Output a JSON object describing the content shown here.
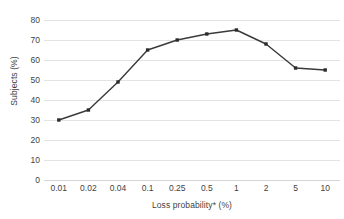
{
  "chart_data": {
    "type": "line",
    "title": "",
    "xlabel": "Loss probability* (%)",
    "ylabel": "Subjects (%)",
    "categories": [
      "0.01",
      "0.02",
      "0.04",
      "0.1",
      "0.25",
      "0.5",
      "1",
      "2",
      "5",
      "10"
    ],
    "values": [
      30,
      35,
      49,
      65,
      70,
      73,
      75,
      68,
      56,
      55
    ],
    "series": [
      {
        "name": "Subjects",
        "values": [
          30,
          35,
          49,
          65,
          70,
          73,
          75,
          68,
          56,
          55
        ]
      }
    ],
    "ylim": [
      0,
      80
    ],
    "ytick_step": 10,
    "yticks": [
      "80",
      "70",
      "60",
      "50",
      "40",
      "30",
      "20",
      "10",
      "0"
    ],
    "ytick_values": [
      80,
      70,
      60,
      50,
      40,
      30,
      20,
      10,
      0
    ],
    "grid": "horizontal",
    "legend": "none",
    "marker": "square",
    "line_color": "#3a3a3a",
    "marker_color": "#2b2b2b",
    "grid_color": "#e3e3e3",
    "background_color": "#ffffff",
    "text_color": "#3f3f3f"
  }
}
